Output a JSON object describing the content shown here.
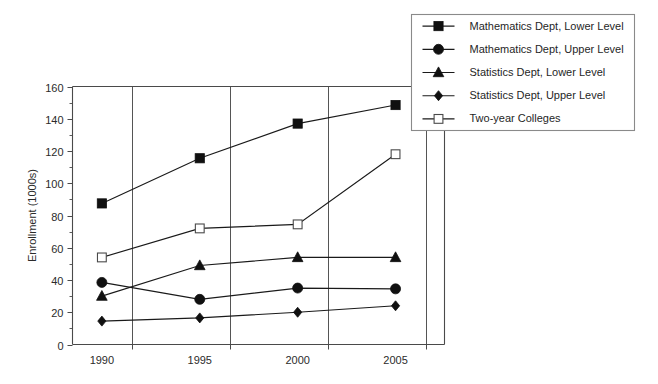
{
  "chart_data": {
    "type": "line",
    "title": "",
    "xlabel": "",
    "ylabel": "Enrollment (1000s)",
    "categories": [
      "1990",
      "1995",
      "2000",
      "2005"
    ],
    "x": [
      1990,
      1995,
      2000,
      2005
    ],
    "xlim": [
      1988.5,
      2007.5
    ],
    "ylim": [
      0,
      160
    ],
    "y_ticks": [
      0,
      20,
      40,
      60,
      80,
      100,
      120,
      140,
      160
    ],
    "y_minor_ticks": [
      10,
      30,
      50,
      70,
      90,
      110,
      130,
      150
    ],
    "grid": "vertical-only",
    "legend_position": "top-right-outside",
    "series": [
      {
        "name": "Mathematics Dept, Lower Level",
        "marker": "square-filled",
        "values": [
          87.5,
          115.5,
          137.0,
          148.5
        ]
      },
      {
        "name": "Mathematics Dept, Upper Level",
        "marker": "circle-filled",
        "values": [
          38.5,
          28.0,
          35.0,
          34.5
        ]
      },
      {
        "name": "Statistics Dept, Lower Level",
        "marker": "triangle-filled",
        "values": [
          30.0,
          49.0,
          54.0,
          54.0
        ]
      },
      {
        "name": "Statistics Dept, Upper Level",
        "marker": "diamond-filled",
        "values": [
          14.5,
          16.5,
          20.0,
          24.0
        ]
      },
      {
        "name": "Two-year Colleges",
        "marker": "square-open",
        "values": [
          54.0,
          72.0,
          74.5,
          118.0
        ]
      }
    ]
  },
  "legend": {
    "items": [
      {
        "label": "Mathematics Dept, Lower Level",
        "marker": "square-filled"
      },
      {
        "label": "Mathematics Dept, Upper Level",
        "marker": "circle-filled"
      },
      {
        "label": "Statistics Dept, Lower Level",
        "marker": "triangle-filled"
      },
      {
        "label": "Statistics Dept, Upper Level",
        "marker": "diamond-filled"
      },
      {
        "label": "Two-year Colleges",
        "marker": "square-open"
      }
    ]
  },
  "colors": {
    "series_line": "#1a1a1a",
    "marker_fill": "#101010",
    "marker_open_fill": "#ffffff",
    "axis": "#4a4a4a",
    "gridline": "#555555",
    "legend_border": "#8a8a8a",
    "background": "#ffffff"
  }
}
